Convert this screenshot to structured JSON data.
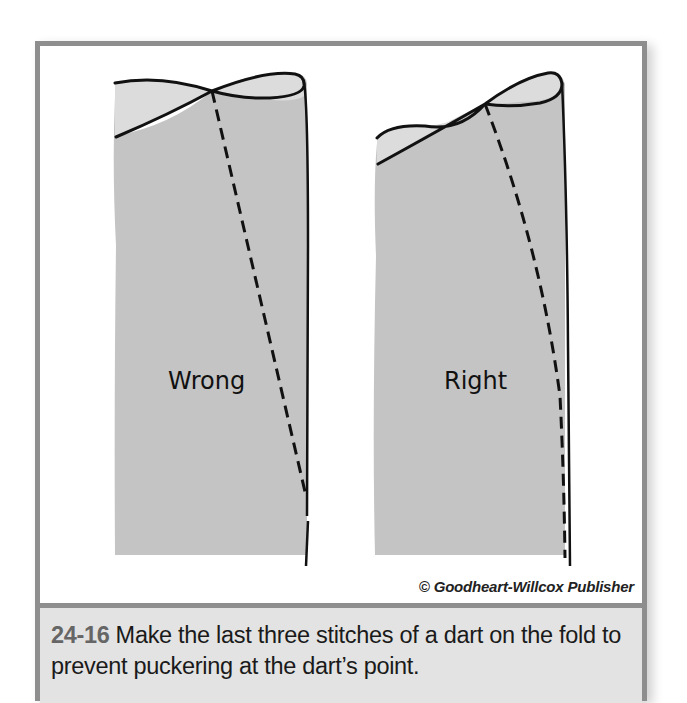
{
  "figure": {
    "panels": [
      {
        "label": "Wrong",
        "stitch_style": "dashed line ending before the fold"
      },
      {
        "label": "Right",
        "stitch_style": "dashed line tapering onto the fold"
      }
    ],
    "credit": "© Goodheart-Willcox Publisher",
    "caption": {
      "number": "24-16",
      "text": "Make the last three stitches of a dart on the fold to prevent puckering at the dart’s point."
    }
  },
  "colors": {
    "border": "#8e8e8e",
    "fabric_main": "#c4c4c4",
    "fabric_top": "#dcdcdc",
    "caption_bg": "#e3e3e3",
    "fig_number": "#666666"
  }
}
